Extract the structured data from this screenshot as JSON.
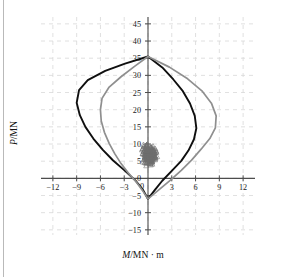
{
  "figure": {
    "background_color": "#ffffff",
    "page_edge_color": "#b9b9b9"
  },
  "chart_data": {
    "type": "line",
    "title": "",
    "subtitle": "",
    "xlabel": "M/MN · m",
    "xlabel_symbol": "M",
    "xlabel_unit": "/MN · m",
    "ylabel": "P/MN",
    "ylabel_symbol": "P",
    "ylabel_unit": "/MN",
    "xlim": [
      -13.5,
      13.5
    ],
    "ylim": [
      -16.5,
      47
    ],
    "xticks": [
      -12,
      -9,
      -6,
      -3,
      0,
      3,
      6,
      9,
      12
    ],
    "yticks": [
      45,
      40,
      35,
      30,
      25,
      20,
      15,
      10,
      5,
      0,
      -5,
      -10,
      -15
    ],
    "xtick_labels": [
      "−12",
      "−9",
      "−6",
      "−3",
      "0",
      "3",
      "6",
      "9",
      "12"
    ],
    "ytick_labels": [
      "45",
      "40",
      "35",
      "30",
      "25",
      "20",
      "15",
      "10",
      "5",
      "0",
      "−5",
      "−10",
      "−15"
    ],
    "grid": true,
    "grid_style": "dashed",
    "grid_color": "#d8d8d8",
    "axis_color": "#4d4d4d",
    "legend": "none",
    "legend_position": "none",
    "series": [
      {
        "name": "curve-black",
        "color": "#0f0f0f",
        "line_width": 1.9,
        "closed": true,
        "points": [
          [
            0.0,
            35.5
          ],
          [
            -2.9,
            33.4
          ],
          [
            -5.4,
            31.3
          ],
          [
            -7.6,
            28.6
          ],
          [
            -8.7,
            25.7
          ],
          [
            -9.0,
            22.0
          ],
          [
            -8.6,
            18.4
          ],
          [
            -7.9,
            15.0
          ],
          [
            -6.9,
            11.6
          ],
          [
            -5.7,
            8.3
          ],
          [
            -4.4,
            5.2
          ],
          [
            -3.0,
            2.4
          ],
          [
            -1.6,
            -0.6
          ],
          [
            -0.7,
            -3.1
          ],
          [
            0.0,
            -6.0
          ],
          [
            0.9,
            -3.3
          ],
          [
            1.8,
            -0.7
          ],
          [
            3.0,
            2.2
          ],
          [
            4.2,
            5.1
          ],
          [
            5.1,
            8.1
          ],
          [
            5.8,
            11.4
          ],
          [
            6.1,
            14.6
          ],
          [
            5.9,
            18.2
          ],
          [
            5.3,
            21.8
          ],
          [
            4.4,
            25.4
          ],
          [
            3.2,
            28.8
          ],
          [
            1.8,
            32.3
          ],
          [
            0.0,
            35.5
          ]
        ]
      },
      {
        "name": "curve-gray",
        "color": "#8f8f8f",
        "line_width": 1.7,
        "closed": true,
        "points": [
          [
            0.0,
            35.5
          ],
          [
            -1.7,
            32.6
          ],
          [
            -3.4,
            29.6
          ],
          [
            -4.9,
            26.6
          ],
          [
            -5.8,
            23.3
          ],
          [
            -6.0,
            20.0
          ],
          [
            -5.9,
            16.7
          ],
          [
            -5.5,
            13.4
          ],
          [
            -4.9,
            10.2
          ],
          [
            -4.2,
            7.2
          ],
          [
            -3.4,
            4.3
          ],
          [
            -2.5,
            1.6
          ],
          [
            -1.5,
            -1.0
          ],
          [
            -0.7,
            -3.5
          ],
          [
            0.0,
            -6.0
          ],
          [
            1.4,
            -3.3
          ],
          [
            2.8,
            -0.6
          ],
          [
            4.2,
            2.3
          ],
          [
            5.5,
            5.3
          ],
          [
            6.7,
            8.5
          ],
          [
            7.8,
            11.6
          ],
          [
            8.5,
            14.7
          ],
          [
            8.6,
            18.2
          ],
          [
            8.0,
            21.9
          ],
          [
            6.8,
            25.5
          ],
          [
            5.0,
            29.0
          ],
          [
            2.7,
            32.4
          ],
          [
            0.0,
            35.5
          ]
        ]
      }
    ],
    "scatter": {
      "name": "demand-points",
      "marker": "triangle",
      "color": "#6e6e6e",
      "marker_size": 2.6,
      "count": 260,
      "x_range": [
        -0.95,
        1.35
      ],
      "y_range": [
        3.3,
        10.6
      ],
      "center": [
        0.25,
        7.0
      ],
      "description": "dense cluster of small triangular demand points near M ≈ 0, P ≈ 4–10"
    }
  }
}
